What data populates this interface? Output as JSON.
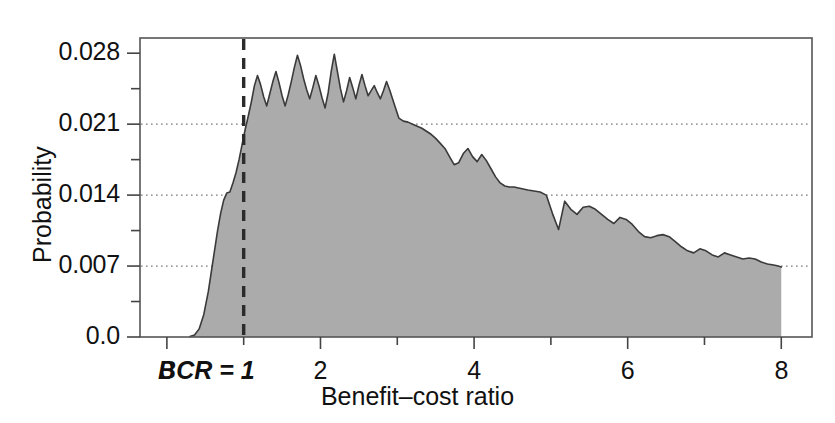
{
  "chart_data": {
    "type": "area",
    "title": "",
    "xlabel": "Benefit–cost ratio",
    "ylabel": "Probability",
    "xlim": [
      -0.35,
      8.4
    ],
    "ylim": [
      0.0,
      0.0295
    ],
    "grid": "horizontal-dotted",
    "legend": "none",
    "fill_color": "#ababab",
    "line_color": "#3a3a3a",
    "xticks": [
      0,
      1,
      2,
      3,
      4,
      5,
      6,
      7,
      8
    ],
    "xtick_labels": [
      "0",
      "",
      "2",
      "",
      "4",
      "",
      "6",
      "",
      "8"
    ],
    "yticks": [
      0.0,
      0.0035,
      0.007,
      0.0105,
      0.014,
      0.0175,
      0.021,
      0.0245,
      0.028
    ],
    "ytick_labels": [
      "0.0",
      "",
      "0.007",
      "",
      "0.014",
      "",
      "0.021",
      "",
      "0.028"
    ],
    "gridlines_y": [
      0.007,
      0.014,
      0.021
    ],
    "annotations": [
      {
        "name": "bcr-equals-one",
        "text": "BCR = 1",
        "x": 1,
        "style": "dashed-vertical-line",
        "color": "#2b2b2b"
      }
    ],
    "x": [
      0.3,
      0.36,
      0.42,
      0.48,
      0.54,
      0.58,
      0.62,
      0.66,
      0.7,
      0.74,
      0.78,
      0.82,
      0.86,
      0.9,
      0.94,
      0.98,
      1.02,
      1.06,
      1.1,
      1.14,
      1.18,
      1.22,
      1.26,
      1.3,
      1.34,
      1.38,
      1.42,
      1.46,
      1.5,
      1.54,
      1.58,
      1.62,
      1.66,
      1.7,
      1.74,
      1.78,
      1.82,
      1.86,
      1.9,
      1.94,
      1.98,
      2.02,
      2.06,
      2.1,
      2.14,
      2.18,
      2.22,
      2.26,
      2.3,
      2.34,
      2.38,
      2.42,
      2.46,
      2.5,
      2.54,
      2.58,
      2.62,
      2.66,
      2.7,
      2.74,
      2.78,
      2.82,
      2.86,
      2.9,
      2.96,
      3.02,
      3.08,
      3.14,
      3.2,
      3.26,
      3.32,
      3.38,
      3.44,
      3.5,
      3.56,
      3.62,
      3.68,
      3.74,
      3.8,
      3.86,
      3.92,
      3.98,
      4.04,
      4.1,
      4.16,
      4.22,
      4.28,
      4.34,
      4.4,
      4.46,
      4.52,
      4.58,
      4.64,
      4.7,
      4.78,
      4.86,
      4.94,
      5.02,
      5.1,
      5.18,
      5.26,
      5.34,
      5.42,
      5.5,
      5.58,
      5.66,
      5.74,
      5.82,
      5.9,
      5.98,
      6.06,
      6.14,
      6.22,
      6.3,
      6.38,
      6.46,
      6.54,
      6.62,
      6.7,
      6.78,
      6.86,
      6.94,
      7.02,
      7.1,
      7.18,
      7.26,
      7.34,
      7.42,
      7.5,
      7.58,
      7.66,
      7.74,
      7.82,
      7.9,
      7.96,
      8.0
    ],
    "y": [
      5e-05,
      0.0002,
      0.0008,
      0.0022,
      0.0045,
      0.0065,
      0.0085,
      0.0105,
      0.0122,
      0.0135,
      0.0142,
      0.0143,
      0.0152,
      0.0162,
      0.0175,
      0.019,
      0.0205,
      0.0218,
      0.0232,
      0.0248,
      0.0258,
      0.0249,
      0.0237,
      0.0228,
      0.024,
      0.0252,
      0.0262,
      0.0251,
      0.0238,
      0.0228,
      0.0239,
      0.0252,
      0.0266,
      0.0278,
      0.0268,
      0.0255,
      0.0244,
      0.0235,
      0.0246,
      0.0258,
      0.0248,
      0.0236,
      0.0226,
      0.0241,
      0.0262,
      0.0279,
      0.0262,
      0.0245,
      0.0232,
      0.0243,
      0.0256,
      0.0246,
      0.0235,
      0.0248,
      0.0259,
      0.0248,
      0.0238,
      0.0243,
      0.0248,
      0.0241,
      0.0235,
      0.0243,
      0.0252,
      0.0244,
      0.023,
      0.0216,
      0.0213,
      0.0212,
      0.021,
      0.0208,
      0.0206,
      0.0203,
      0.02,
      0.0196,
      0.0191,
      0.0186,
      0.0178,
      0.017,
      0.0172,
      0.0181,
      0.0186,
      0.0178,
      0.0173,
      0.018,
      0.0174,
      0.0166,
      0.0158,
      0.0152,
      0.0149,
      0.0148,
      0.0148,
      0.0147,
      0.0146,
      0.0145,
      0.0144,
      0.0143,
      0.014,
      0.0122,
      0.0106,
      0.0134,
      0.0126,
      0.0121,
      0.0128,
      0.0129,
      0.0126,
      0.0121,
      0.0116,
      0.0112,
      0.0118,
      0.0116,
      0.0111,
      0.0104,
      0.0099,
      0.0098,
      0.01,
      0.0101,
      0.0099,
      0.0094,
      0.0089,
      0.0085,
      0.0083,
      0.0087,
      0.0085,
      0.0081,
      0.0079,
      0.0083,
      0.0081,
      0.0079,
      0.0077,
      0.0078,
      0.0077,
      0.0074,
      0.0072,
      0.0071,
      0.007,
      0.0069,
      0.0068,
      0.0066,
      0.0064,
      0.0062,
      0.0055,
      0.004,
      0.0015,
      0.0
    ]
  }
}
